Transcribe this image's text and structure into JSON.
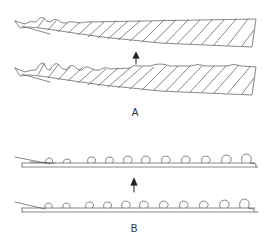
{
  "figure": {
    "panels": [
      {
        "id": "A",
        "label": "A",
        "description": "Two serrated blade drawings with upward arrow between them"
      },
      {
        "id": "B",
        "label": "B",
        "description": "Two strips with curled hook-like projections with upward arrow between them"
      }
    ],
    "colors": {
      "stroke": "#555555",
      "background": "#ffffff"
    }
  }
}
